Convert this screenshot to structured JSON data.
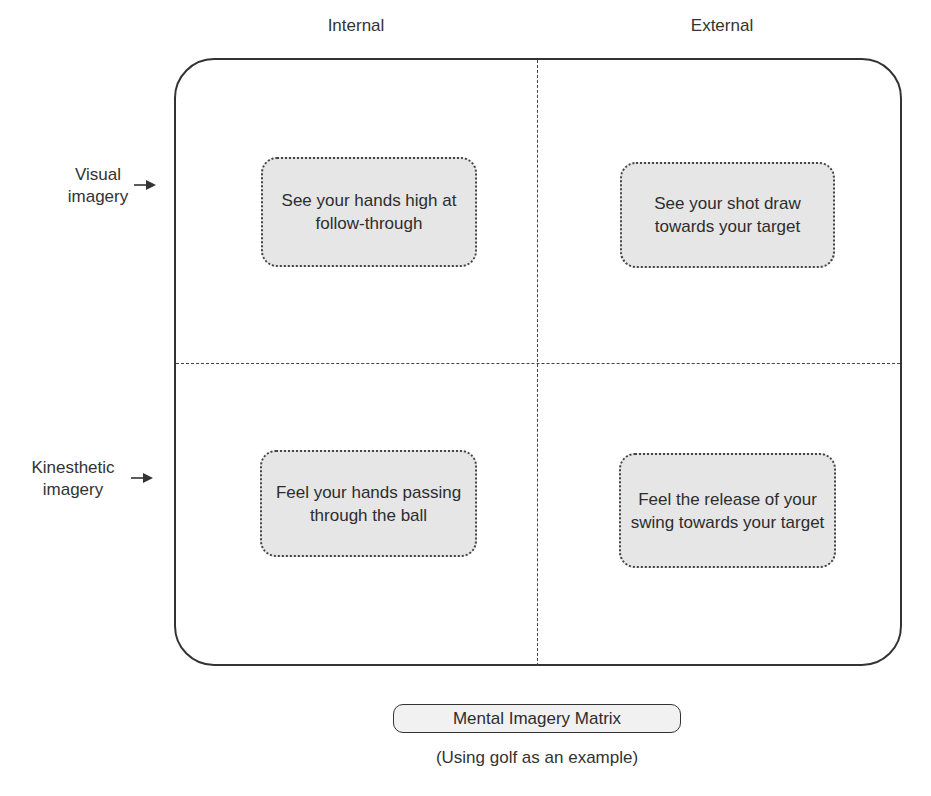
{
  "matrix": {
    "columns": [
      {
        "label": "Internal"
      },
      {
        "label": "External"
      }
    ],
    "rows": [
      {
        "label_line1": "Visual",
        "label_line2": "imagery",
        "arrow": "right-arrow-icon"
      },
      {
        "label_line1": "Kinesthetic",
        "label_line2": "imagery",
        "arrow": "right-arrow-icon"
      }
    ],
    "cells": {
      "visual_internal": "See your hands high at follow-through",
      "visual_external": "See your shot draw towards your target",
      "kinesthetic_internal": "Feel your hands passing through the ball",
      "kinesthetic_external": "Feel the release of your swing towards your target"
    }
  },
  "caption": {
    "title": "Mental Imagery Matrix",
    "subtitle": "(Using golf as an example)"
  },
  "colors": {
    "frame": "#333333",
    "cell_fill": "#e6e6e6",
    "text": "#2d2d2d"
  }
}
